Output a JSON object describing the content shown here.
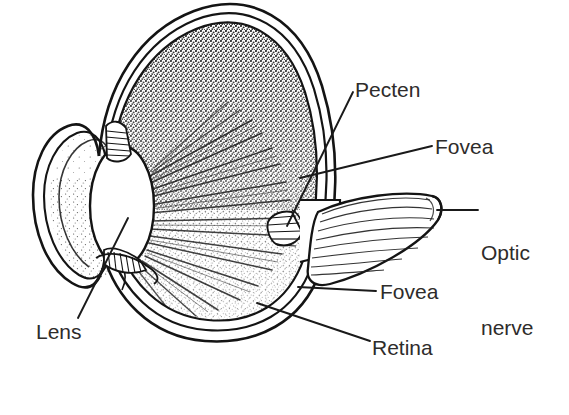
{
  "figure": {
    "kind": "anatomical-line-drawing",
    "background_color": "#ffffff",
    "ink_color": "#1a1a1a",
    "label_color": "#2e2c2b"
  },
  "labels": [
    {
      "id": "pecten",
      "text": "Pecten",
      "x": 355,
      "y": 78,
      "leader": true
    },
    {
      "id": "fovea_upper",
      "text": "Fovea",
      "x": 435,
      "y": 135,
      "leader": true
    },
    {
      "id": "optic_nerve",
      "text": "Optic\nnerve",
      "x": 481,
      "y": 190,
      "leader": true
    },
    {
      "id": "fovea_lower",
      "text": "Fovea",
      "x": 380,
      "y": 280,
      "leader": true
    },
    {
      "id": "retina",
      "text": "Retina",
      "x": 372,
      "y": 336,
      "leader": true
    },
    {
      "id": "lens",
      "text": "Lens",
      "x": 36,
      "y": 320,
      "leader": true
    }
  ],
  "label_text": {
    "pecten": "Pecten",
    "fovea_upper": "Fovea",
    "optic_line1": "Optic",
    "optic_line2": "nerve",
    "fovea_lower": "Fovea",
    "retina": "Retina",
    "lens": "Lens"
  },
  "structures": [
    {
      "id": "sclera",
      "name": "sclera outer wall"
    },
    {
      "id": "choroid",
      "name": "choroid middle layer"
    },
    {
      "id": "retina_layer",
      "name": "retina inner layer, stippled"
    },
    {
      "id": "cornea",
      "name": "cornea anterior bulge"
    },
    {
      "id": "lens_body",
      "name": "lens, white oval"
    },
    {
      "id": "ciliary",
      "name": "ciliary body, hatched"
    },
    {
      "id": "vitreous",
      "name": "vitreous chamber, stippled"
    },
    {
      "id": "pecten_body",
      "name": "pecten, pleated comb structure"
    },
    {
      "id": "optic_stalk",
      "name": "optic nerve stalk, striated"
    }
  ]
}
